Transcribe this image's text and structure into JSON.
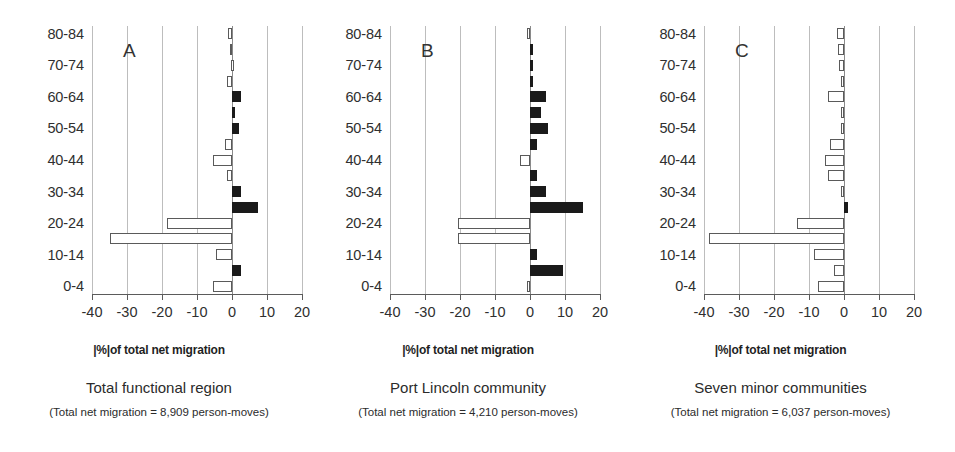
{
  "figure": {
    "axis_title": "|%|of total net migration",
    "x_ticks": [
      "-40",
      "-30",
      "-20",
      "-10",
      "0",
      "10",
      "20"
    ],
    "age_labels_shown": [
      "80-84",
      "70-74",
      "60-64",
      "50-54",
      "40-44",
      "30-34",
      "20-24",
      "10-14",
      "0-4"
    ],
    "colors": {
      "out_migration_fill": "#ffffff",
      "in_migration_fill": "#1a1a1a",
      "bar_stroke": "#5a5a5a",
      "gridline": "#bdbdbd",
      "axis": "#5b5b5b",
      "text": "#2b2b2b"
    }
  },
  "panels": [
    {
      "letter": "A",
      "caption_main": "Total functional region",
      "caption_sub": "(Total net migration = 8,909 person-moves)"
    },
    {
      "letter": "B",
      "caption_main": "Port Lincoln community",
      "caption_sub": "(Total net migration = 4,210 person-moves)"
    },
    {
      "letter": "C",
      "caption_main": "Seven minor communities",
      "caption_sub": "(Total net migration = 6,037 person-moves)"
    }
  ],
  "chart_data": {
    "type": "bar",
    "orientation": "horizontal",
    "title": "",
    "xlabel": "|%|of total net migration",
    "ylabel": "",
    "xlim": [
      -45,
      22
    ],
    "xticks": [
      -40,
      -30,
      -20,
      -10,
      0,
      10,
      20
    ],
    "grid": "vertical",
    "legend": "none",
    "note": "Negative (hollow/white) bars = net out-migration; positive (solid black) bars = net in-migration. Age groups run 0-4 at bottom to 80-84 at top in 5-year bands; only alternating labels are printed.",
    "categories": [
      "0-4",
      "5-9",
      "10-14",
      "15-19",
      "20-24",
      "25-29",
      "30-34",
      "35-39",
      "40-44",
      "45-49",
      "50-54",
      "55-59",
      "60-64",
      "65-69",
      "70-74",
      "75-79",
      "80-84"
    ],
    "series": [
      {
        "name": "Total functional region",
        "panel": "A",
        "total_net_migration_person_moves": 8909,
        "values": [
          -5.5,
          2.5,
          -4.5,
          -35.0,
          -18.5,
          7.5,
          2.5,
          -1.5,
          -5.5,
          -2.0,
          2.0,
          0.8,
          2.5,
          -1.5,
          -0.2,
          -0.7,
          -1.2
        ]
      },
      {
        "name": "Port Lincoln community",
        "panel": "B",
        "total_net_migration_person_moves": 4210,
        "values": [
          -1.0,
          9.5,
          2.0,
          -20.5,
          -20.5,
          15.0,
          4.5,
          2.0,
          -3.0,
          2.0,
          5.0,
          3.0,
          4.5,
          0.7,
          0.8,
          0.3,
          -0.8
        ]
      },
      {
        "name": "Seven minor communities",
        "panel": "C",
        "total_net_migration_person_moves": 6037,
        "values": [
          -7.5,
          -3.0,
          -8.5,
          -38.5,
          -13.5,
          1.2,
          -0.8,
          -4.5,
          -5.5,
          -4.0,
          -0.8,
          -0.8,
          -4.5,
          -1.0,
          -1.5,
          -1.8,
          -2.0
        ]
      }
    ]
  }
}
